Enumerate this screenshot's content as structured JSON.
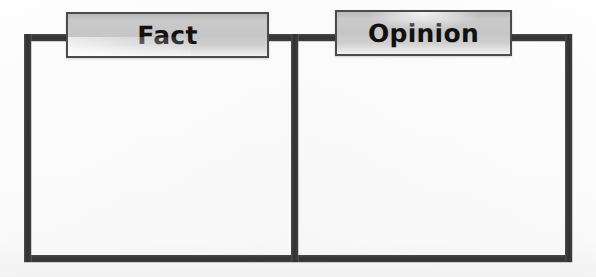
{
  "worksheet": {
    "type": "two-column-graphic-organizer",
    "background_color": "#fefefe",
    "line_color": "#3a3a3a",
    "plate_fill_color": "#c6c6c6",
    "plate_border_color": "#4b4b4b",
    "text_color": "#111111"
  },
  "columns": [
    {
      "id": "fact",
      "heading": "Fact",
      "body_text": ""
    },
    {
      "id": "opinion",
      "heading": "Opinion",
      "body_text": ""
    }
  ]
}
